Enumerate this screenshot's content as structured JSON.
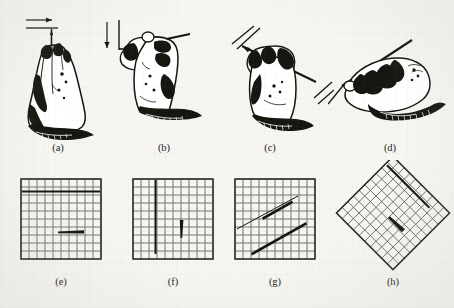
{
  "figure": {
    "kind": "scanned-illustration-figure",
    "background_color": "#f6f5f2",
    "ink_color": "#17150f",
    "grid_line_color": "#6a6a6a",
    "grid_border_color": "#2b2a26",
    "rows": 2,
    "columns": 4,
    "captions_row1": [
      "(a)",
      "(b)",
      "(c)",
      "(d)"
    ],
    "captions_row2": [
      "(e)",
      "(f)",
      "(g)",
      "(h)"
    ]
  },
  "panels": [
    {
      "id": "a",
      "caption": "(a)",
      "content": "hand gripping pencil in vertical posture, drawing a horizontal stroke",
      "stroke_direction": "horizontal",
      "arrow": "arrow-right",
      "guide_line": "horizontal-line"
    },
    {
      "id": "b",
      "caption": "(b)",
      "content": "hand gripping pencil in horizontal posture, drawing a vertical stroke",
      "stroke_direction": "vertical",
      "arrow": "arrow-down",
      "guide_line": "vertical-line-with-horizontal-base"
    },
    {
      "id": "c",
      "caption": "(c)",
      "content": "hand gripping pencil tilted, drawing an oblique stroke up-right",
      "stroke_direction": "diagonal-up-right",
      "arrow": "none",
      "guide_line": "two-parallel-oblique-lines"
    },
    {
      "id": "d",
      "caption": "(d)",
      "content": "hand gripping pencil low, drawing an oblique stroke toward lower-left",
      "stroke_direction": "diagonal-up-right-low-grip",
      "arrow": "none",
      "guide_line": "single-oblique-line"
    },
    {
      "id": "e",
      "caption": "(e)",
      "content": "square grid with one long horizontal ruled line and one short thick horizontal stroke",
      "grid": {
        "type": "square",
        "cells_x": 10,
        "cells_y": 10,
        "rotation_deg": 0
      },
      "marks": [
        {
          "kind": "long-line",
          "orientation": "horizontal",
          "row": 2,
          "from_col": 0,
          "to_col": 10,
          "weight": "medium"
        },
        {
          "kind": "short-stroke",
          "orientation": "horizontal",
          "row": 6,
          "from_col": 5,
          "to_col": 7,
          "weight": "heavy"
        }
      ]
    },
    {
      "id": "f",
      "caption": "(f)",
      "content": "square grid with one long vertical ruled line and one short thick vertical stroke",
      "grid": {
        "type": "square",
        "cells_x": 10,
        "cells_y": 10,
        "rotation_deg": 0
      },
      "marks": [
        {
          "kind": "long-line",
          "orientation": "vertical",
          "col": 3,
          "from_row": 0,
          "to_row": 9,
          "weight": "medium"
        },
        {
          "kind": "short-stroke",
          "orientation": "vertical",
          "col": 6,
          "from_row": 5,
          "to_row": 7,
          "weight": "heavy"
        }
      ]
    },
    {
      "id": "g",
      "caption": "(g)",
      "content": "square grid with two parallel oblique strokes rising to the right",
      "grid": {
        "type": "square",
        "cells_x": 10,
        "cells_y": 10,
        "rotation_deg": 0
      },
      "marks": [
        {
          "kind": "oblique-line",
          "position": "upper",
          "slope_deg": 27,
          "weight": "light-with-heavy-midsection"
        },
        {
          "kind": "oblique-line",
          "position": "lower",
          "slope_deg": 27,
          "weight": "heavy"
        }
      ]
    },
    {
      "id": "h",
      "caption": "(h)",
      "content": "grid rotated 45 degrees (diamond) with one long stroke along a grid diagonal and one short thick tapered stroke",
      "grid": {
        "type": "square",
        "cells_x": 10,
        "cells_y": 10,
        "rotation_deg": 45
      },
      "marks": [
        {
          "kind": "long-line",
          "orientation": "along-grid-diagonal",
          "weight": "medium"
        },
        {
          "kind": "short-stroke",
          "orientation": "along-grid-diagonal",
          "weight": "heavy-tapered"
        }
      ]
    }
  ]
}
